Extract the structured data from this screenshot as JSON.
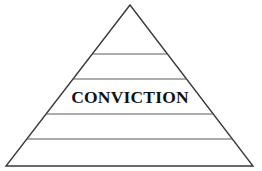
{
  "figure": {
    "background_color": "#ffffff",
    "outline_color": "#3a3a3a",
    "divider_color": "#5a5a5a",
    "label_color": "#111111"
  },
  "chart_data": {
    "type": "pyramid",
    "title": "",
    "subtitle": "",
    "xlabel": "",
    "ylabel": "",
    "legend_position": "none",
    "grid": false,
    "apex": {
      "x": 130,
      "y": 5
    },
    "base_left": {
      "x": 6,
      "y": 166
    },
    "base_right": {
      "x": 253,
      "y": 166
    },
    "divider_y": [
      54,
      79,
      114,
      139
    ],
    "band_count": 5,
    "bands": [
      {
        "index": 0,
        "label": "",
        "y_top": 5,
        "y_bottom": 54
      },
      {
        "index": 1,
        "label": "",
        "y_top": 54,
        "y_bottom": 79
      },
      {
        "index": 2,
        "label": "CONVICTION",
        "y_top": 79,
        "y_bottom": 114
      },
      {
        "index": 3,
        "label": "",
        "y_top": 114,
        "y_bottom": 139
      },
      {
        "index": 4,
        "label": "",
        "y_top": 139,
        "y_bottom": 166
      }
    ],
    "labels": [
      "CONVICTION"
    ],
    "annotations": []
  },
  "label": {
    "conviction": "CONVICTION",
    "x": 130,
    "y": 103
  }
}
